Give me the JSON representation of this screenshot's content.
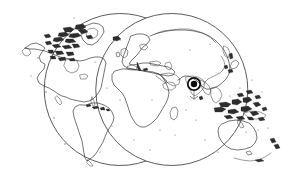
{
  "map": {
    "title": "World Map",
    "projection_name": "double-hemisphere",
    "background_color": "#ffffff",
    "outline_color": "#4a4a4a",
    "coastline_color": "#2b2b2b",
    "frame": {
      "left_circle": {
        "cx": 86,
        "cy": 90,
        "r": 76
      },
      "right_circle": {
        "cx": 207,
        "cy": 90,
        "r": 76
      },
      "top_intersection": {
        "x": 146,
        "y": 18
      },
      "bottom_intersection": {
        "x": 146,
        "y": 161
      }
    },
    "marker": {
      "name": "location-marker",
      "cx": 194,
      "cy": 84,
      "outer_radius": 6.2,
      "inner_radius": 3.2,
      "ring_color": "#111111",
      "dot_color": "#0d0d0d",
      "label": ""
    },
    "landmasses": [
      {
        "name": "north-america"
      },
      {
        "name": "south-america"
      },
      {
        "name": "greenland"
      },
      {
        "name": "canadian-arctic-archipelago"
      },
      {
        "name": "europe"
      },
      {
        "name": "africa"
      },
      {
        "name": "madagascar"
      },
      {
        "name": "asia"
      },
      {
        "name": "arabian-peninsula"
      },
      {
        "name": "india"
      },
      {
        "name": "japan"
      },
      {
        "name": "indonesia-philippines"
      },
      {
        "name": "australia"
      },
      {
        "name": "new-zealand"
      },
      {
        "name": "british-isles"
      },
      {
        "name": "iceland"
      },
      {
        "name": "caribbean"
      }
    ]
  }
}
